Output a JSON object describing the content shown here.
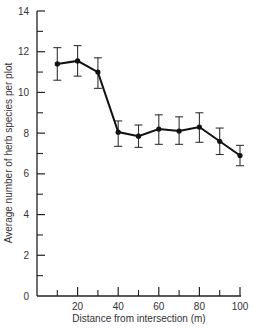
{
  "chart_data": {
    "type": "line",
    "title": "",
    "xlabel": "Distance from intersection (m)",
    "ylabel": "Average number of herb species per plot",
    "xlim": [
      0,
      100
    ],
    "ylim": [
      0,
      14
    ],
    "x_ticks_major": [
      20,
      40,
      60,
      80,
      100
    ],
    "x_ticks_minor": [
      10,
      30,
      50,
      70,
      90
    ],
    "y_ticks_major": [
      0,
      2,
      4,
      6,
      8,
      10,
      12,
      14
    ],
    "y_ticks_minor": [
      1,
      3,
      5,
      7,
      9,
      11,
      13
    ],
    "x_tick_labels": [
      "20",
      "40",
      "60",
      "80",
      "100"
    ],
    "y_tick_labels": [
      "0",
      "2",
      "4",
      "6",
      "8",
      "10",
      "12",
      "14"
    ],
    "origin_label": "0",
    "grid": false,
    "legend": null,
    "series": [
      {
        "name": "Herb species",
        "x": [
          10,
          20,
          30,
          40,
          50,
          60,
          70,
          80,
          90,
          100
        ],
        "values": [
          11.4,
          11.55,
          11.0,
          8.05,
          7.85,
          8.2,
          8.1,
          8.3,
          7.6,
          6.9
        ],
        "error_upper": [
          12.2,
          12.3,
          11.7,
          8.6,
          8.4,
          8.9,
          8.8,
          9.0,
          8.25,
          7.4
        ],
        "error_lower": [
          10.6,
          10.8,
          10.2,
          7.35,
          7.3,
          7.45,
          7.45,
          7.55,
          6.95,
          6.4
        ],
        "color": "#111111"
      }
    ]
  }
}
